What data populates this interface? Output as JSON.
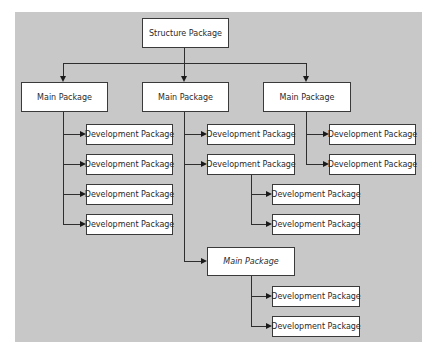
{
  "diagram": {
    "colors": {
      "background": "#c8c8c8",
      "box": "#ffffff",
      "border": "#3a3a3a",
      "line": "#2e2e2e"
    },
    "root": {
      "label": "Structure Package"
    },
    "main_packages": [
      {
        "label": "Main Package",
        "children": [
          "Development Package",
          "Development Package",
          "Development Package",
          "Development Package"
        ]
      },
      {
        "label": "Main Package",
        "children": [
          {
            "label": "Development Package"
          },
          {
            "label": "Development Package",
            "children": [
              "Development Package",
              "Development Package"
            ]
          },
          {
            "label": "Main Package",
            "children": [
              "Development Package",
              "Development Package"
            ]
          }
        ]
      },
      {
        "label": "Main Package",
        "children": [
          "Development Package",
          "Development Package"
        ]
      }
    ]
  }
}
